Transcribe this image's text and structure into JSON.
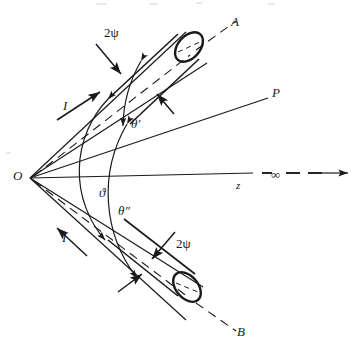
{
  "figure": {
    "type": "optics-beam-geometry-diagram",
    "background_color": "#ffffff",
    "line_color": "#1a1a1a"
  },
  "labels": {
    "origin": "O",
    "beam_a": "A",
    "beam_b": "B",
    "point_p": "P",
    "axis_z": "z",
    "infinity": "∞",
    "intensity_upper": "I",
    "intensity_lower": "I",
    "aperture_upper": "2ψ",
    "aperture_lower": "2ψ",
    "angle_total": "ϑ",
    "angle_upper": "θ′",
    "angle_lower": "θ″"
  },
  "geometry": {
    "origin_point": {
      "x": 30,
      "y": 178
    },
    "z_axis": {
      "solid_end_x": 253,
      "dash_segments": [
        [
          262,
          270
        ],
        [
          284,
          300
        ],
        [
          306,
          322
        ]
      ],
      "arrow_tip_x": 350,
      "y": 173
    },
    "ray_p": {
      "end_x": 268,
      "end_y": 98
    },
    "beam_a_axis": {
      "end_x": 236,
      "end_y": 33
    },
    "beam_b_axis": {
      "end_x": 236,
      "end_y": 322
    },
    "arc_inner_radius": 105,
    "arc_outer_radius": 135
  }
}
